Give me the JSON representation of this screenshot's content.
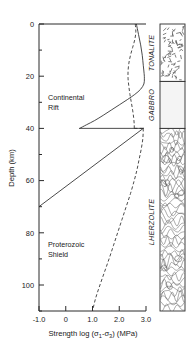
{
  "figure": {
    "title": "",
    "axes": {
      "x": {
        "label": "Strength log (σ₁-σ₃) (MPa)",
        "label_parts": {
          "pre": "Strength log (",
          "sigma1": "σ",
          "sub1": "1",
          "minus": "-",
          "sigma3": "σ",
          "sub3": "3",
          "post": ") (MPa)"
        },
        "ticks": [
          "-1.0",
          "0",
          "1.0",
          "2.0",
          "3.0"
        ],
        "tick_values": [
          -1.0,
          0.0,
          1.0,
          2.0,
          3.0
        ],
        "range": [
          -1.0,
          3.0
        ]
      },
      "y": {
        "label": "Depth (km)",
        "ticks": [
          "0",
          "20",
          "40",
          "60",
          "80",
          "100"
        ],
        "tick_values": [
          0,
          20,
          40,
          60,
          80,
          100
        ],
        "minor_tick_values": [
          10,
          30,
          50,
          70,
          90,
          110
        ],
        "range": [
          0,
          110
        ],
        "direction": "inverted"
      }
    },
    "annotations": [
      {
        "name": "continental-rift-label",
        "line1": "Continental",
        "line2": "Rift"
      },
      {
        "name": "proterozoic-shield-label",
        "line1": "Proterozoic",
        "line2": "Shield"
      }
    ],
    "lithology_column": {
      "layers": [
        {
          "name": "tonalite",
          "label": "TONALITE",
          "top_km": 0,
          "bottom_km": 22,
          "pattern": "stipple-dash",
          "color": "#ffffff"
        },
        {
          "name": "gabbro",
          "label": "GABBRO",
          "top_km": 22,
          "bottom_km": 40,
          "pattern": "blank",
          "color": "#f4f4f4"
        },
        {
          "name": "lherzolite",
          "label": "LHERZOLITE",
          "top_km": 40,
          "bottom_km": 110,
          "pattern": "swirl-contour",
          "color": "#ffffff"
        }
      ]
    }
  },
  "chart_data": {
    "type": "line",
    "title": "",
    "xlabel": "Strength log (σ₁-σ₃) (MPa)",
    "ylabel": "Depth (km)",
    "xlim": [
      -1.0,
      3.0
    ],
    "ylim": [
      110,
      0
    ],
    "grid": false,
    "legend": "annotated-inline",
    "series": [
      {
        "name": "Continental Rift",
        "style": "solid",
        "color": "#2b2b2b",
        "segments": [
          {
            "comment": "brittle-ductile envelope, crust 0-40 km",
            "points": [
              [
                2.64,
                0
              ],
              [
                2.72,
                4
              ],
              [
                2.8,
                8
              ],
              [
                2.86,
                12
              ],
              [
                2.9,
                16
              ],
              [
                2.93,
                19
              ],
              [
                2.94,
                21
              ],
              [
                2.92,
                23
              ],
              [
                2.8,
                25
              ],
              [
                2.58,
                27
              ],
              [
                2.3,
                29
              ],
              [
                2.0,
                31
              ],
              [
                1.7,
                33
              ],
              [
                1.4,
                35
              ],
              [
                1.08,
                37
              ],
              [
                0.78,
                38.6
              ],
              [
                0.52,
                40
              ]
            ]
          },
          {
            "comment": "Moho strength jump at 40 km",
            "points": [
              [
                0.52,
                40
              ],
              [
                2.9,
                40
              ]
            ]
          },
          {
            "comment": "mantle ductile decay 40-70 km",
            "points": [
              [
                2.9,
                40
              ],
              [
                -1.0,
                70
              ]
            ]
          }
        ]
      },
      {
        "name": "Proterozoic Shield",
        "style": "dashed",
        "color": "#2b2b2b",
        "segments": [
          {
            "comment": "crustal envelope 0-40 km",
            "points": [
              [
                2.6,
                0
              ],
              [
                2.62,
                3
              ],
              [
                2.58,
                6
              ],
              [
                2.5,
                9
              ],
              [
                2.42,
                12
              ],
              [
                2.36,
                15
              ],
              [
                2.33,
                18
              ],
              [
                2.33,
                21
              ],
              [
                2.36,
                24
              ],
              [
                2.4,
                27
              ],
              [
                2.45,
                30
              ],
              [
                2.5,
                33
              ],
              [
                2.54,
                36
              ],
              [
                2.56,
                38.5
              ],
              [
                2.56,
                40
              ]
            ]
          },
          {
            "comment": "Moho jump at 40 km",
            "points": [
              [
                2.56,
                40
              ],
              [
                2.9,
                40
              ]
            ]
          },
          {
            "comment": "mantle ductile decay 40-110 km",
            "points": [
              [
                2.9,
                40
              ],
              [
                2.88,
                44
              ],
              [
                2.82,
                48
              ],
              [
                2.74,
                52
              ],
              [
                2.66,
                56
              ],
              [
                2.56,
                60
              ],
              [
                2.42,
                65
              ],
              [
                2.26,
                70
              ],
              [
                2.1,
                75
              ],
              [
                1.94,
                80
              ],
              [
                1.78,
                85
              ],
              [
                1.62,
                90
              ],
              [
                1.45,
                95
              ],
              [
                1.28,
                100
              ],
              [
                1.12,
                105
              ],
              [
                1.0,
                110
              ]
            ]
          }
        ]
      }
    ]
  }
}
